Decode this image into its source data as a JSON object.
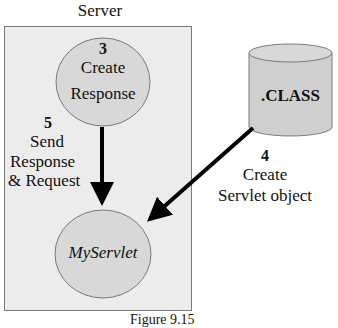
{
  "server": {
    "title": "Server"
  },
  "nodes": {
    "create_response": {
      "step": "3",
      "line1": "Create",
      "line2": "Response"
    },
    "myservlet": {
      "label": "MyServlet"
    },
    "class_store": {
      "label": ".CLASS"
    }
  },
  "edges": {
    "send": {
      "step": "5",
      "line1": "Send",
      "line2": "Response",
      "line3": "& Request"
    },
    "create_servlet": {
      "step": "4",
      "line1": "Create",
      "line2": "Servlet object"
    }
  },
  "caption": "Figure 9.15",
  "colors": {
    "server_bg": "#ececec",
    "node_fill": "#d8d8d8",
    "border": "#7a7a7a",
    "arrow": "#000000"
  }
}
